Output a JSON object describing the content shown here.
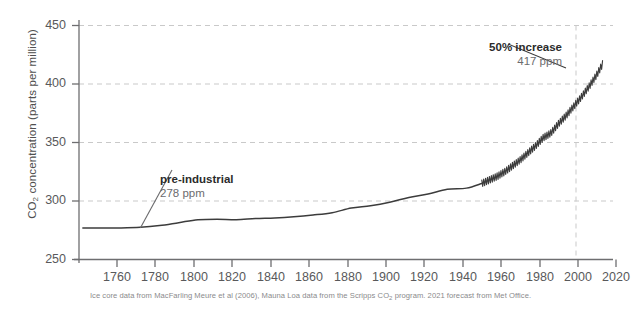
{
  "chart_data": {
    "type": "line",
    "title": "",
    "xlabel": "",
    "ylabel": "CO2 concentration (parts per million)",
    "ylabel_parts": {
      "pre": "CO",
      "sub": "2",
      "post": " concentration (parts per million)"
    },
    "xlim": [
      1748,
      2028
    ],
    "ylim": [
      250,
      450
    ],
    "yticks": [
      250,
      300,
      350,
      400,
      450
    ],
    "xticks": [
      1760,
      1780,
      1800,
      1820,
      1840,
      1860,
      1880,
      1900,
      1920,
      1940,
      1960,
      1980,
      2000,
      2020
    ],
    "grid": "horizontal-dashed",
    "vertical_gridline_at": 2020,
    "legend": "none",
    "line_color": "#3c3c3c",
    "grid_color": "#c8c8c8",
    "axis_color": "#6e6e70",
    "series": [
      {
        "name": "Ice core (MacFarling Meure et al 2006)",
        "style": "smooth",
        "x": [
          1750,
          1760,
          1770,
          1780,
          1790,
          1800,
          1810,
          1820,
          1830,
          1840,
          1850,
          1860,
          1870,
          1880,
          1890,
          1900,
          1910,
          1920,
          1930,
          1940,
          1950,
          1958
        ],
        "values": [
          277,
          277,
          277,
          277.5,
          279,
          281.5,
          284,
          284.5,
          284,
          285,
          285.5,
          286.5,
          288,
          290,
          294,
          296,
          299,
          303,
          306,
          310,
          311,
          315
        ]
      },
      {
        "name": "Mauna Loa (Scripps CO2 program)",
        "style": "sawtooth-seasonal",
        "x": [
          1958,
          1962,
          1966,
          1970,
          1974,
          1978,
          1982,
          1986,
          1990,
          1994,
          1998,
          2002,
          2006,
          2010,
          2014,
          2018,
          2021
        ],
        "values": [
          315,
          318,
          321,
          325,
          330,
          335,
          341,
          347,
          354,
          358,
          366,
          373,
          381,
          389,
          398,
          408,
          417
        ],
        "seasonal_amplitude_ppm": 3
      }
    ],
    "annotations": [
      {
        "id": "pre-industrial",
        "title": "pre-industrial",
        "value": "278 ppm",
        "points_to_year": 1780,
        "points_to_ppm": 277
      },
      {
        "id": "current",
        "title": "50% increase",
        "value": "417 ppm",
        "points_to_year": 2021,
        "points_to_ppm": 417
      }
    ],
    "footnote": "Ice core data from MacFarling Meure et al (2006), Mauna Loa data from the Scripps CO2 program. 2021 forecast from Met Office.",
    "footnote_parts": {
      "a": "Ice core data from MacFarling Meure et al (2006), Mauna Loa data from the Scripps CO",
      "sub": "2",
      "b": " program. 2021 forecast from Met Office."
    }
  }
}
